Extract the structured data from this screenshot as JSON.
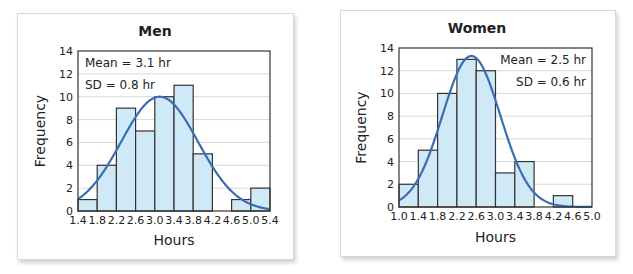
{
  "colors": {
    "bar_fill": "#cfeaf6",
    "bar_stroke": "#333333",
    "curve": "#3a6db4",
    "grid": "#d9d9d9",
    "axis": "#333333"
  },
  "chart_data": [
    {
      "type": "bar",
      "title": "Men",
      "xlabel": "Hours",
      "ylabel": "Frequency",
      "x_ticks": [
        "1.4",
        "1.8",
        "2.2",
        "2.6",
        "3.0",
        "3.4",
        "3.8",
        "4.2",
        "4.6",
        "5.0",
        "5.4"
      ],
      "y_ticks": [
        "0",
        "2",
        "4",
        "6",
        "8",
        "10",
        "12",
        "14"
      ],
      "xlim": [
        1.4,
        5.4
      ],
      "ylim": [
        0,
        14
      ],
      "bin_width": 0.4,
      "categories": [
        "1.4-1.8",
        "1.8-2.2",
        "2.2-2.6",
        "2.6-3.0",
        "3.0-3.4",
        "3.4-3.8",
        "3.8-4.2",
        "4.2-4.6",
        "4.6-5.0",
        "5.0-5.4"
      ],
      "values": [
        1,
        4,
        9,
        7,
        10,
        11,
        5,
        0,
        1,
        2
      ],
      "annotation": {
        "mean": "Mean = 3.1 hr",
        "sd": "SD = 0.8 hr",
        "position": "top-left"
      },
      "normal_curve": {
        "mean": 3.1,
        "sd": 0.8,
        "peak": 10
      },
      "grid": true
    },
    {
      "type": "bar",
      "title": "Women",
      "xlabel": "Hours",
      "ylabel": "Frequency",
      "x_ticks": [
        "1.0",
        "1.4",
        "1.8",
        "2.2",
        "2.6",
        "3.0",
        "3.4",
        "3.8",
        "4.2",
        "4.6",
        "5.0"
      ],
      "y_ticks": [
        "0",
        "2",
        "4",
        "6",
        "8",
        "10",
        "12",
        "14"
      ],
      "xlim": [
        1.0,
        5.0
      ],
      "ylim": [
        0,
        14
      ],
      "bin_width": 0.4,
      "categories": [
        "1.0-1.4",
        "1.4-1.8",
        "1.8-2.2",
        "2.2-2.6",
        "2.6-3.0",
        "3.0-3.4",
        "3.4-3.8",
        "3.8-4.2",
        "4.2-4.6",
        "4.6-5.0"
      ],
      "values": [
        2,
        5,
        10,
        13,
        12,
        3,
        4,
        0,
        1,
        0
      ],
      "annotation": {
        "mean": "Mean = 2.5 hr",
        "sd": "SD = 0.6 hr",
        "position": "top-right"
      },
      "normal_curve": {
        "mean": 2.5,
        "sd": 0.6,
        "peak": 13.3
      },
      "grid": true
    }
  ]
}
